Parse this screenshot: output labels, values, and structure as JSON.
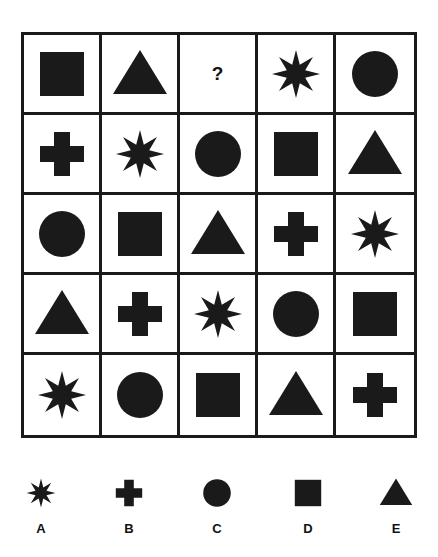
{
  "puzzle": {
    "grid": [
      [
        "square",
        "triangle",
        "?",
        "star",
        "circle"
      ],
      [
        "cross",
        "star",
        "circle",
        "square",
        "triangle"
      ],
      [
        "circle",
        "square",
        "triangle",
        "cross",
        "star"
      ],
      [
        "triangle",
        "cross",
        "star",
        "circle",
        "square"
      ],
      [
        "star",
        "circle",
        "square",
        "triangle",
        "cross"
      ]
    ],
    "missing_symbol": "?",
    "fill_color": "#1a1a1a"
  },
  "options": [
    {
      "label": "A",
      "shape": "star"
    },
    {
      "label": "B",
      "shape": "cross"
    },
    {
      "label": "C",
      "shape": "circle"
    },
    {
      "label": "D",
      "shape": "square"
    },
    {
      "label": "E",
      "shape": "triangle"
    }
  ]
}
